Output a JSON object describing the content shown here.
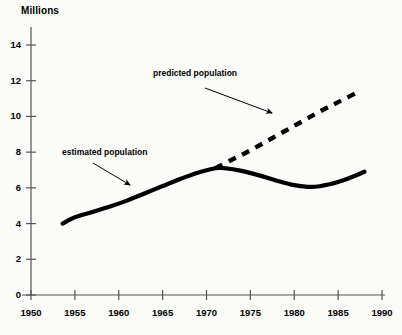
{
  "chart_data": {
    "type": "line",
    "title": "",
    "xlabel": "",
    "ylabel": "Millions",
    "xlim": [
      1950,
      1990
    ],
    "ylim": [
      0,
      14
    ],
    "grid": false,
    "legend_position": "inline-annotations",
    "x_ticks": [
      "1950",
      "1955",
      "1960",
      "1965",
      "1970",
      "1975",
      "1980",
      "1985",
      "1990"
    ],
    "y_ticks": [
      "0",
      "2",
      "4",
      "6",
      "8",
      "10",
      "12",
      "14"
    ],
    "series": [
      {
        "name": "estimated population",
        "style": "solid",
        "color": "#000000",
        "x": [
          1953.6,
          1955,
          1957,
          1959,
          1961,
          1963,
          1965,
          1967,
          1969,
          1971,
          1972,
          1974,
          1976,
          1978,
          1980,
          1982,
          1984,
          1986,
          1988
        ],
        "values": [
          4.0,
          4.35,
          4.65,
          4.95,
          5.3,
          5.7,
          6.1,
          6.5,
          6.85,
          7.1,
          7.1,
          6.95,
          6.7,
          6.4,
          6.15,
          6.05,
          6.2,
          6.5,
          6.9
        ]
      },
      {
        "name": "predicted population",
        "style": "dashed",
        "color": "#000000",
        "x": [
          1971,
          1973,
          1975,
          1977,
          1979,
          1981,
          1983,
          1985,
          1987
        ],
        "values": [
          7.1,
          7.6,
          8.1,
          8.65,
          9.2,
          9.75,
          10.3,
          10.8,
          11.3
        ]
      }
    ],
    "annotations": [
      {
        "text": "estimated population",
        "text_x": 62,
        "text_y": 147,
        "arrow_from_x": 93,
        "arrow_from_y": 163,
        "arrow_to_x": 130,
        "arrow_to_y": 185
      },
      {
        "text": "predicted population",
        "text_x": 153,
        "text_y": 68,
        "arrow_from_x": 205,
        "arrow_from_y": 88,
        "arrow_to_x": 272,
        "arrow_to_y": 113
      }
    ]
  }
}
